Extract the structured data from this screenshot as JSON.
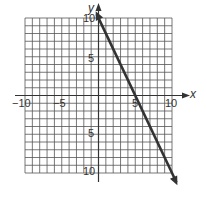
{
  "chart_data": {
    "type": "line",
    "title": "",
    "xlabel": "x",
    "ylabel": "y",
    "xlim": [
      -10,
      10
    ],
    "ylim": [
      -10,
      10
    ],
    "grid": true,
    "grid_step": 1,
    "x_ticks_labeled": [
      -10,
      -5,
      5,
      10
    ],
    "y_ticks_labeled": [
      10,
      5,
      -5,
      -10
    ],
    "tick_labels": {
      "x_neg10": "−10",
      "x_neg5": "−5",
      "x_pos5": "5",
      "x_pos10": "10",
      "y_pos10": "10",
      "y_pos5": "5",
      "y_neg5": "5",
      "y_neg10": "10"
    },
    "series": [
      {
        "name": "y = -2x + 10",
        "equation": "y = -2x + 10",
        "slope": -2,
        "y_intercept": 10,
        "x_intercept": 5,
        "points": [
          [
            0,
            10
          ],
          [
            5,
            0
          ],
          [
            10,
            -10
          ]
        ],
        "arrows": "both",
        "color": "#333333"
      }
    ],
    "legend": null
  },
  "colors": {
    "grid": "#555555",
    "line": "#333333",
    "text": "#333333"
  }
}
